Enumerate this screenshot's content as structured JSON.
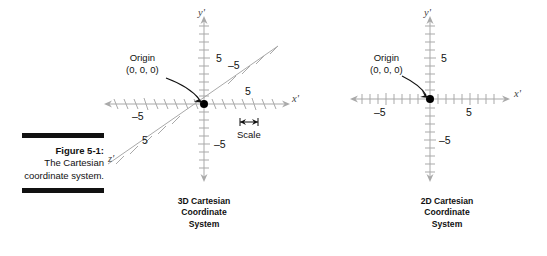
{
  "figure": {
    "number_label": "Figure 5-1:",
    "description": "The Cartesian coordinate system.",
    "rule_color": "#111111"
  },
  "panels": [
    {
      "id": "3d",
      "caption_lines": [
        "3D Cartesian",
        "Coordinate",
        "System"
      ],
      "axis_labels": {
        "x": "x'",
        "y": "y'",
        "z": "z'"
      },
      "origin_annotation": {
        "title": "Origin",
        "coords": "(0, 0, 0)"
      },
      "scale_annotation": "Scale",
      "tick_labels": {
        "y_positive": "5",
        "y_negative": "–5",
        "x_positive": "5",
        "x_negative": "–5",
        "z_positive": "–5",
        "z_negative": "5"
      },
      "axis_color": "#a9a9a9",
      "origin_dot_color": "#000000"
    },
    {
      "id": "2d",
      "caption_lines": [
        "2D Cartesian",
        "Coordinate",
        "System"
      ],
      "axis_labels": {
        "x": "x'",
        "y": "y'"
      },
      "origin_annotation": {
        "title": "Origin",
        "coords": "(0, 0, 0)"
      },
      "tick_labels": {
        "y_positive": "5",
        "y_negative": "–5",
        "x_positive": "5",
        "x_negative": "–5"
      },
      "axis_color": "#a9a9a9",
      "origin_dot_color": "#000000"
    }
  ]
}
